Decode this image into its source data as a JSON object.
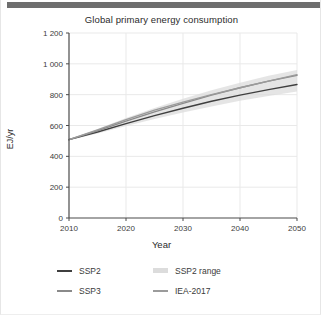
{
  "window": {
    "top_bar_color": "#6e6e6e"
  },
  "chart_data": {
    "type": "line",
    "title": "Global primary energy consumption",
    "xlabel": "Year",
    "ylabel": "EJ/yr",
    "xlim": [
      2010,
      2050
    ],
    "ylim": [
      0,
      1200
    ],
    "xticks": [
      2010,
      2020,
      2030,
      2040,
      2050
    ],
    "xticklabels": [
      "2010",
      "2020",
      "2030",
      "2040",
      "2050"
    ],
    "yticks": [
      0,
      200,
      400,
      600,
      800,
      1000,
      1200
    ],
    "yticklabels": [
      "0",
      "200",
      "400",
      "600",
      "800",
      "1 000",
      "1 200"
    ],
    "grid": true,
    "legend_position": "below",
    "x": [
      2010,
      2015,
      2020,
      2025,
      2030,
      2035,
      2040,
      2045,
      2050
    ],
    "series": [
      {
        "name": "SSP2",
        "color": "#3f3f3f",
        "kind": "line",
        "values": [
          508,
          558,
          612,
          664,
          712,
          757,
          797,
          833,
          866
        ]
      },
      {
        "name": "SSP3",
        "color": "#8a8a8a",
        "kind": "line",
        "values": [
          508,
          566,
          628,
          688,
          744,
          797,
          845,
          888,
          925
        ]
      },
      {
        "name": "IEA-2017",
        "color": "#9b9b9b",
        "kind": "line",
        "values": [
          508,
          572,
          638,
          700,
          752,
          800,
          845,
          888,
          930
        ]
      },
      {
        "name": "SSP2 range",
        "color": "#dcdcdc",
        "kind": "band",
        "lower": [
          505,
          548,
          596,
          642,
          685,
          724,
          760,
          792,
          820
        ],
        "upper": [
          512,
          578,
          648,
          714,
          774,
          829,
          878,
          922,
          960
        ]
      }
    ],
    "legend": [
      {
        "label": "SSP2",
        "color": "#3f3f3f",
        "style": "line"
      },
      {
        "label": "SSP2 range",
        "color": "#dcdcdc",
        "style": "band"
      },
      {
        "label": "SSP3",
        "color": "#8a8a8a",
        "style": "line"
      },
      {
        "label": "IEA-2017",
        "color": "#9b9b9b",
        "style": "line"
      }
    ]
  }
}
